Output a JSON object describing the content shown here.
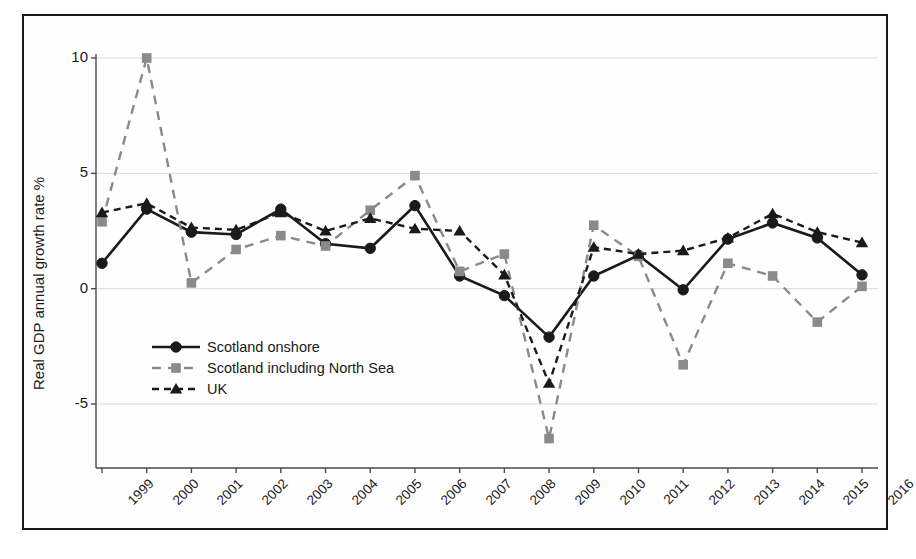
{
  "figure": {
    "border_color": "#1a1a1a",
    "background": "#ffffff"
  },
  "axis": {
    "ylabel": "Real GDP annual growth rate %",
    "yticks": [
      "10",
      "5",
      "0",
      "-5"
    ]
  },
  "legend": {
    "items": [
      {
        "label": "Scotland onshore",
        "marker": "circle-marker",
        "style": "solid",
        "color": "#1a1a1a"
      },
      {
        "label": "Scotland including North Sea",
        "marker": "square-marker",
        "style": "dashed",
        "color": "#8a8a8a"
      },
      {
        "label": "UK",
        "marker": "triangle-marker",
        "style": "dashed",
        "color": "#1a1a1a"
      }
    ]
  },
  "chart_data": {
    "type": "line",
    "title": "",
    "xlabel": "",
    "ylabel": "Real GDP annual growth rate %",
    "categories": [
      "1999",
      "2000",
      "2001",
      "2002",
      "2003",
      "2004",
      "2005",
      "2006",
      "2007",
      "2008",
      "2009",
      "2010",
      "2011",
      "2012",
      "2013",
      "2014",
      "2015",
      "2016"
    ],
    "ylim": [
      -7.5,
      11
    ],
    "yticks": [
      10,
      5,
      0,
      -5
    ],
    "grid": true,
    "legend_position": "inside-lower-left",
    "series": [
      {
        "name": "Scotland onshore",
        "color": "#1a1a1a",
        "style": "solid",
        "marker": "circle",
        "values": [
          1.1,
          3.45,
          2.45,
          2.35,
          3.45,
          1.95,
          1.75,
          3.6,
          0.55,
          -0.3,
          -2.1,
          0.55,
          1.45,
          -0.05,
          2.15,
          2.85,
          2.2,
          0.6
        ]
      },
      {
        "name": "Scotland including North Sea",
        "color": "#8a8a8a",
        "style": "dashed",
        "marker": "square",
        "values": [
          2.9,
          10.0,
          0.25,
          1.7,
          2.3,
          1.85,
          3.4,
          4.9,
          0.75,
          1.5,
          -6.5,
          2.75,
          1.4,
          -3.3,
          1.1,
          0.55,
          -1.45,
          0.1
        ]
      },
      {
        "name": "UK",
        "color": "#1a1a1a",
        "style": "dashed",
        "marker": "triangle",
        "values": [
          3.3,
          3.7,
          2.65,
          2.55,
          3.3,
          2.5,
          3.05,
          2.6,
          2.5,
          0.6,
          -4.1,
          1.8,
          1.5,
          1.65,
          2.2,
          3.25,
          2.45,
          2.0
        ]
      }
    ]
  }
}
